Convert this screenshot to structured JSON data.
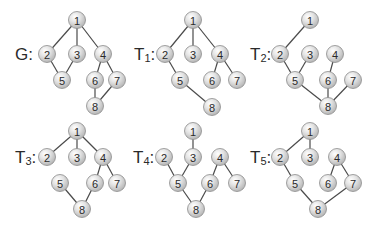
{
  "colors": {
    "edge": "#4a4a4a",
    "node_fill_light": "#f4f4f4",
    "node_fill_dark": "#b9b9b9",
    "node_stroke": "#8c8c8c",
    "text": "#2a2a2a"
  },
  "graphs": [
    {
      "id": "G",
      "label_main": "G",
      "label_sub": "",
      "label_suffix": ":",
      "label_pos": [
        15,
        54
      ],
      "nodes": [
        {
          "id": "1",
          "x": 77,
          "y": 20
        },
        {
          "id": "2",
          "x": 47,
          "y": 54
        },
        {
          "id": "3",
          "x": 77,
          "y": 54
        },
        {
          "id": "4",
          "x": 103,
          "y": 54
        },
        {
          "id": "5",
          "x": 62,
          "y": 80
        },
        {
          "id": "6",
          "x": 95,
          "y": 80
        },
        {
          "id": "7",
          "x": 117,
          "y": 80
        },
        {
          "id": "8",
          "x": 95,
          "y": 106
        }
      ],
      "edges": [
        [
          "1",
          "2"
        ],
        [
          "1",
          "3"
        ],
        [
          "1",
          "4"
        ],
        [
          "2",
          "5"
        ],
        [
          "3",
          "5"
        ],
        [
          "4",
          "6"
        ],
        [
          "4",
          "7"
        ],
        [
          "6",
          "8"
        ],
        [
          "7",
          "8"
        ]
      ]
    },
    {
      "id": "T1",
      "label_main": "T",
      "label_sub": "1",
      "label_suffix": ":",
      "label_pos": [
        134,
        54
      ],
      "nodes": [
        {
          "id": "1",
          "x": 193,
          "y": 20
        },
        {
          "id": "2",
          "x": 165,
          "y": 54
        },
        {
          "id": "3",
          "x": 193,
          "y": 54
        },
        {
          "id": "4",
          "x": 220,
          "y": 54
        },
        {
          "id": "5",
          "x": 180,
          "y": 80
        },
        {
          "id": "6",
          "x": 212,
          "y": 80
        },
        {
          "id": "7",
          "x": 237,
          "y": 80
        },
        {
          "id": "8",
          "x": 212,
          "y": 107
        }
      ],
      "edges": [
        [
          "1",
          "2"
        ],
        [
          "1",
          "3"
        ],
        [
          "1",
          "4"
        ],
        [
          "2",
          "5"
        ],
        [
          "4",
          "6"
        ],
        [
          "4",
          "7"
        ],
        [
          "5",
          "8"
        ]
      ]
    },
    {
      "id": "T2",
      "label_main": "T",
      "label_sub": "2",
      "label_suffix": ":",
      "label_pos": [
        250,
        54
      ],
      "nodes": [
        {
          "id": "1",
          "x": 310,
          "y": 20
        },
        {
          "id": "2",
          "x": 280,
          "y": 54
        },
        {
          "id": "3",
          "x": 310,
          "y": 54
        },
        {
          "id": "4",
          "x": 335,
          "y": 54
        },
        {
          "id": "5",
          "x": 295,
          "y": 80
        },
        {
          "id": "6",
          "x": 328,
          "y": 80
        },
        {
          "id": "7",
          "x": 353,
          "y": 80
        },
        {
          "id": "8",
          "x": 328,
          "y": 106
        }
      ],
      "edges": [
        [
          "1",
          "2"
        ],
        [
          "2",
          "5"
        ],
        [
          "3",
          "5"
        ],
        [
          "4",
          "6"
        ],
        [
          "5",
          "8"
        ],
        [
          "6",
          "8"
        ],
        [
          "7",
          "8"
        ]
      ]
    },
    {
      "id": "T3",
      "label_main": "T",
      "label_sub": "3",
      "label_suffix": ":",
      "label_pos": [
        15,
        157
      ],
      "nodes": [
        {
          "id": "1",
          "x": 77,
          "y": 131
        },
        {
          "id": "2",
          "x": 47,
          "y": 157
        },
        {
          "id": "3",
          "x": 77,
          "y": 157
        },
        {
          "id": "4",
          "x": 103,
          "y": 157
        },
        {
          "id": "5",
          "x": 60,
          "y": 183
        },
        {
          "id": "6",
          "x": 95,
          "y": 183
        },
        {
          "id": "7",
          "x": 117,
          "y": 183
        },
        {
          "id": "8",
          "x": 82,
          "y": 209
        }
      ],
      "edges": [
        [
          "1",
          "2"
        ],
        [
          "1",
          "3"
        ],
        [
          "1",
          "4"
        ],
        [
          "4",
          "6"
        ],
        [
          "4",
          "7"
        ],
        [
          "5",
          "8"
        ],
        [
          "6",
          "8"
        ]
      ]
    },
    {
      "id": "T4",
      "label_main": "T",
      "label_sub": "4",
      "label_suffix": ":",
      "label_pos": [
        133,
        157
      ],
      "nodes": [
        {
          "id": "1",
          "x": 193,
          "y": 131
        },
        {
          "id": "2",
          "x": 164,
          "y": 157
        },
        {
          "id": "3",
          "x": 193,
          "y": 157
        },
        {
          "id": "4",
          "x": 220,
          "y": 157
        },
        {
          "id": "5",
          "x": 178,
          "y": 183
        },
        {
          "id": "6",
          "x": 210,
          "y": 183
        },
        {
          "id": "7",
          "x": 237,
          "y": 183
        },
        {
          "id": "8",
          "x": 196,
          "y": 209
        }
      ],
      "edges": [
        [
          "1",
          "3"
        ],
        [
          "2",
          "5"
        ],
        [
          "3",
          "5"
        ],
        [
          "4",
          "6"
        ],
        [
          "4",
          "7"
        ],
        [
          "5",
          "8"
        ],
        [
          "6",
          "8"
        ]
      ]
    },
    {
      "id": "T5",
      "label_main": "T",
      "label_sub": "5",
      "label_suffix": ":",
      "label_pos": [
        250,
        157
      ],
      "nodes": [
        {
          "id": "1",
          "x": 310,
          "y": 131
        },
        {
          "id": "2",
          "x": 280,
          "y": 157
        },
        {
          "id": "3",
          "x": 310,
          "y": 157
        },
        {
          "id": "4",
          "x": 337,
          "y": 157
        },
        {
          "id": "5",
          "x": 295,
          "y": 183
        },
        {
          "id": "6",
          "x": 328,
          "y": 183
        },
        {
          "id": "7",
          "x": 353,
          "y": 183
        },
        {
          "id": "8",
          "x": 318,
          "y": 209
        }
      ],
      "edges": [
        [
          "1",
          "2"
        ],
        [
          "1",
          "3"
        ],
        [
          "2",
          "5"
        ],
        [
          "4",
          "6"
        ],
        [
          "4",
          "7"
        ],
        [
          "5",
          "8"
        ],
        [
          "7",
          "8"
        ]
      ]
    }
  ]
}
